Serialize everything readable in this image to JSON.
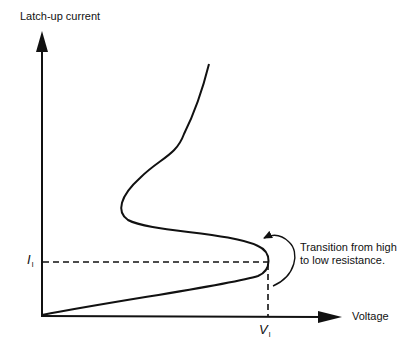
{
  "diagram": {
    "y_axis_label": "Latch-up current",
    "x_axis_label": "Voltage",
    "current_marker": {
      "symbol": "I",
      "subscript": "l"
    },
    "voltage_marker": {
      "symbol": "V",
      "subscript": "l"
    },
    "annotation": {
      "line1": "Transition from high",
      "line2": "to low resistance."
    },
    "colors": {
      "line": "#111111",
      "background": "#ffffff"
    }
  }
}
